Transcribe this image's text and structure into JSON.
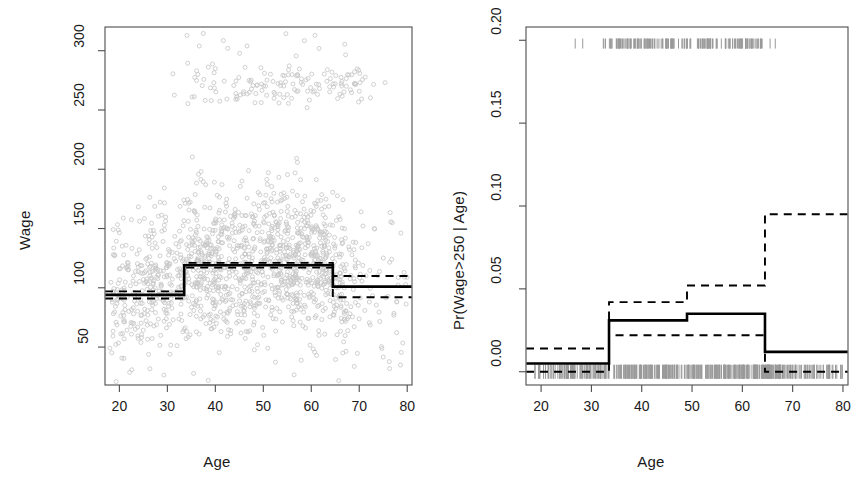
{
  "figure": {
    "background": "#ffffff",
    "point_color": "#c8c8c8",
    "line_color": "#000000",
    "axis_color": "#4d4d4d",
    "rug_color": "#999999"
  },
  "panels": [
    {
      "id": "left",
      "xlabel": "Age",
      "ylabel": "Wage",
      "xticks": [
        "20",
        "30",
        "40",
        "50",
        "60",
        "70",
        "80"
      ],
      "yticks": [
        "50",
        "100",
        "150",
        "200",
        "250",
        "300"
      ]
    },
    {
      "id": "right",
      "xlabel": "Age",
      "ylabel": "Pr(Wage>250 | Age)",
      "xticks": [
        "20",
        "30",
        "40",
        "50",
        "60",
        "70",
        "80"
      ],
      "yticks": [
        "0.00",
        "0.05",
        "0.10",
        "0.15",
        "0.20"
      ]
    }
  ],
  "chart_data": [
    {
      "type": "scatter",
      "panel": "left",
      "title": "",
      "xlabel": "Age",
      "ylabel": "Wage",
      "xlim": [
        17,
        81
      ],
      "ylim": [
        18,
        320
      ],
      "xticks": [
        20,
        30,
        40,
        50,
        60,
        70,
        80
      ],
      "yticks": [
        50,
        100,
        150,
        200,
        250,
        300
      ],
      "grid": false,
      "legend": "none",
      "point_style": "open-circle",
      "point_color": "#c8c8c8",
      "n_points": 3000,
      "cutpoints": [
        33.5,
        49,
        64.5
      ],
      "series": [
        {
          "name": "Fitted step function",
          "style": "solid",
          "type": "step",
          "breaks": [
            17,
            33.5,
            64.5,
            81
          ],
          "values": [
            94,
            119,
            101
          ]
        },
        {
          "name": "Upper 95% confidence band",
          "style": "dashed",
          "type": "step",
          "breaks": [
            17,
            33.5,
            64.5,
            81
          ],
          "values": [
            97,
            121,
            110
          ]
        },
        {
          "name": "Lower 95% confidence band",
          "style": "dashed",
          "type": "step",
          "breaks": [
            17,
            33.5,
            64.5,
            81
          ],
          "values": [
            91,
            117,
            92
          ]
        }
      ],
      "scatter_description": {
        "main_cloud_center": 110,
        "main_cloud_spread": [
          20,
          200
        ],
        "high_wage_band": [
          258,
          285
        ],
        "high_wage_band_age_range": [
          25,
          75
        ]
      }
    },
    {
      "type": "line",
      "panel": "right",
      "title": "",
      "xlabel": "Age",
      "ylabel": "Pr(Wage>250 | Age)",
      "xlim": [
        17,
        81
      ],
      "ylim": [
        -0.008,
        0.208
      ],
      "xticks": [
        20,
        30,
        40,
        50,
        60,
        70,
        80
      ],
      "yticks": [
        0.0,
        0.05,
        0.1,
        0.15,
        0.2
      ],
      "grid": false,
      "legend": "none",
      "cutpoints": [
        33.5,
        49,
        64.5
      ],
      "series": [
        {
          "name": "Fitted probability step function",
          "style": "solid",
          "type": "step",
          "breaks": [
            17,
            33.5,
            49,
            64.5,
            81
          ],
          "values": [
            0.005,
            0.031,
            0.035,
            0.012
          ]
        },
        {
          "name": "Upper 95% confidence band",
          "style": "dashed",
          "type": "step",
          "breaks": [
            17,
            33.5,
            49,
            64.5,
            81
          ],
          "values": [
            0.014,
            0.042,
            0.052,
            0.095
          ]
        },
        {
          "name": "Lower 95% confidence band",
          "style": "dashed",
          "type": "step",
          "breaks": [
            17,
            33.5,
            49,
            64.5,
            81
          ],
          "values": [
            0.0,
            0.022,
            0.022,
            0.0
          ]
        }
      ],
      "rug_top": {
        "value": 0.198,
        "description": "Observations with Wage > 250",
        "age_range": [
          25,
          68
        ]
      },
      "rug_bottom": {
        "value": 0.0,
        "description": "Observations with Wage <= 250",
        "age_range": [
          18,
          80
        ]
      }
    }
  ]
}
